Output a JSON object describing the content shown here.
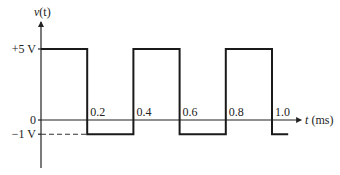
{
  "chart_data": {
    "type": "line",
    "title": "",
    "ylabel": "v(t)",
    "xlabel": "t (ms)",
    "xlabel_var": "t",
    "xlabel_unit": "(ms)",
    "ylabel_var": "v",
    "ylabel_arg": "(t)",
    "xlim": [
      0,
      1.1
    ],
    "ylim": [
      -1.6,
      6.5
    ],
    "x_ticks": [
      0.2,
      0.4,
      0.6,
      0.8,
      1.0
    ],
    "x_tick_labels": [
      "0.2",
      "0.4",
      "0.6",
      "0.8",
      "1.0"
    ],
    "y_ticks": [
      5,
      0,
      -1
    ],
    "y_tick_labels": [
      "+5 V",
      "0",
      "−1 V"
    ],
    "grid": false,
    "series": [
      {
        "name": "v(t) square wave",
        "x": [
          0,
          0.2,
          0.2,
          0.4,
          0.4,
          0.6,
          0.6,
          0.8,
          0.8,
          1.0,
          1.0,
          1.07
        ],
        "y": [
          5,
          5,
          -1,
          -1,
          5,
          5,
          -1,
          -1,
          5,
          5,
          -1,
          -1
        ]
      }
    ],
    "annotations": [
      {
        "type": "dashed-reference",
        "from_x": 0,
        "to_x": 0.2,
        "y": -1
      }
    ]
  }
}
